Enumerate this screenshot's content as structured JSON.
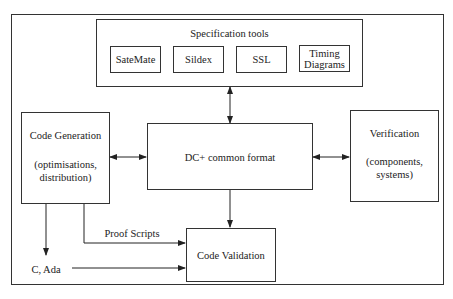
{
  "diagram": {
    "spec_tools": {
      "title": "Specification tools",
      "tools": [
        {
          "label": "SateMate"
        },
        {
          "label": "Sildex"
        },
        {
          "label": "SSL"
        },
        {
          "label_line1": "Timing",
          "label_line2": "Diagrams"
        }
      ]
    },
    "code_generation": {
      "title": "Code Generation",
      "detail_line1": "(optimisations,",
      "detail_line2": "distribution)"
    },
    "common_format": {
      "title": "DC+ common format"
    },
    "verification": {
      "title": "Verification",
      "detail_line1": "(components,",
      "detail_line2": "systems)"
    },
    "code_validation": {
      "title": "Code Validation"
    },
    "proof_scripts_label": "Proof Scripts",
    "c_ada_label": "C, Ada",
    "edges": [
      {
        "from": "Specification tools",
        "to": "DC+ common format",
        "type": "bidirectional"
      },
      {
        "from": "Code Generation",
        "to": "DC+ common format",
        "type": "bidirectional"
      },
      {
        "from": "DC+ common format",
        "to": "Verification",
        "type": "bidirectional"
      },
      {
        "from": "DC+ common format",
        "to": "Code Validation",
        "type": "directed"
      },
      {
        "from": "Code Generation",
        "to": "Code Validation",
        "label": "Proof Scripts",
        "type": "directed"
      },
      {
        "from": "Code Generation",
        "to": "C, Ada",
        "type": "directed"
      },
      {
        "from": "C, Ada",
        "to": "Code Validation",
        "type": "directed"
      }
    ]
  }
}
